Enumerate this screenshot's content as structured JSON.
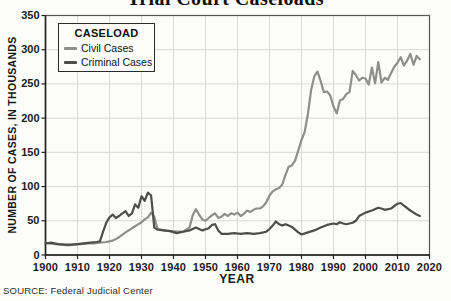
{
  "title": "Trial Court Caseloads",
  "source_note": "SOURCE: Federal Judicial Center",
  "legend": {
    "title": "CASELOAD",
    "items": [
      "Civil Cases",
      "Criminal Cases"
    ]
  },
  "chart_data": {
    "type": "line",
    "title": "Trial Court Caseloads",
    "xlabel": "YEAR",
    "ylabel": "NUMBER OF CASES, IN THOUSANDS",
    "xlim": [
      1900,
      2020
    ],
    "ylim": [
      0,
      350
    ],
    "x_ticks": [
      1900,
      1910,
      1920,
      1930,
      1940,
      1950,
      1960,
      1970,
      1980,
      1990,
      2000,
      2010,
      2020
    ],
    "y_ticks": [
      0,
      50,
      100,
      150,
      200,
      250,
      300,
      350
    ],
    "grid": true,
    "legend_position": "top-left",
    "colors": {
      "grid": "#d9d9d9",
      "frame": "#555555",
      "axis": "#222222",
      "background": "#fcfcfa"
    },
    "series": [
      {
        "name": "Civil Cases",
        "color": "#8e8e8e",
        "points": [
          [
            1900,
            18
          ],
          [
            1901,
            17
          ],
          [
            1903,
            16
          ],
          [
            1905,
            15
          ],
          [
            1907,
            14
          ],
          [
            1909,
            15
          ],
          [
            1911,
            16
          ],
          [
            1913,
            17
          ],
          [
            1915,
            17
          ],
          [
            1917,
            18
          ],
          [
            1919,
            19
          ],
          [
            1921,
            21
          ],
          [
            1923,
            26
          ],
          [
            1925,
            33
          ],
          [
            1926,
            36
          ],
          [
            1928,
            42
          ],
          [
            1929,
            45
          ],
          [
            1930,
            48
          ],
          [
            1931,
            52
          ],
          [
            1932,
            55
          ],
          [
            1933,
            62
          ],
          [
            1934,
            56
          ],
          [
            1935,
            38
          ],
          [
            1937,
            36
          ],
          [
            1939,
            35
          ],
          [
            1941,
            34
          ],
          [
            1943,
            34
          ],
          [
            1945,
            40
          ],
          [
            1946,
            58
          ],
          [
            1947,
            67
          ],
          [
            1948,
            59
          ],
          [
            1949,
            52
          ],
          [
            1950,
            50
          ],
          [
            1951,
            54
          ],
          [
            1952,
            58
          ],
          [
            1953,
            61
          ],
          [
            1954,
            54
          ],
          [
            1955,
            56
          ],
          [
            1956,
            60
          ],
          [
            1957,
            57
          ],
          [
            1958,
            61
          ],
          [
            1959,
            59
          ],
          [
            1960,
            62
          ],
          [
            1961,
            57
          ],
          [
            1962,
            60
          ],
          [
            1963,
            65
          ],
          [
            1964,
            63
          ],
          [
            1965,
            66
          ],
          [
            1966,
            68
          ],
          [
            1967,
            68
          ],
          [
            1968,
            71
          ],
          [
            1969,
            77
          ],
          [
            1970,
            87
          ],
          [
            1971,
            93
          ],
          [
            1972,
            96
          ],
          [
            1973,
            98
          ],
          [
            1974,
            103
          ],
          [
            1975,
            117
          ],
          [
            1976,
            129
          ],
          [
            1977,
            131
          ],
          [
            1978,
            138
          ],
          [
            1979,
            153
          ],
          [
            1980,
            168
          ],
          [
            1981,
            180
          ],
          [
            1982,
            206
          ],
          [
            1983,
            241
          ],
          [
            1984,
            261
          ],
          [
            1985,
            268
          ],
          [
            1986,
            254
          ],
          [
            1987,
            238
          ],
          [
            1988,
            239
          ],
          [
            1989,
            233
          ],
          [
            1990,
            217
          ],
          [
            1991,
            207
          ],
          [
            1992,
            226
          ],
          [
            1993,
            228
          ],
          [
            1994,
            235
          ],
          [
            1995,
            238
          ],
          [
            1996,
            269
          ],
          [
            1997,
            263
          ],
          [
            1998,
            255
          ],
          [
            1999,
            259
          ],
          [
            2000,
            258
          ],
          [
            2001,
            249
          ],
          [
            2002,
            274
          ],
          [
            2003,
            251
          ],
          [
            2004,
            282
          ],
          [
            2005,
            252
          ],
          [
            2006,
            259
          ],
          [
            2007,
            256
          ],
          [
            2008,
            266
          ],
          [
            2009,
            275
          ],
          [
            2010,
            281
          ],
          [
            2011,
            289
          ],
          [
            2012,
            277
          ],
          [
            2013,
            284
          ],
          [
            2014,
            294
          ],
          [
            2015,
            278
          ],
          [
            2016,
            291
          ],
          [
            2017,
            286
          ]
        ]
      },
      {
        "name": "Criminal Cases",
        "color": "#4d4d4d",
        "points": [
          [
            1900,
            17
          ],
          [
            1902,
            18
          ],
          [
            1904,
            16
          ],
          [
            1906,
            15
          ],
          [
            1908,
            15
          ],
          [
            1910,
            16
          ],
          [
            1912,
            17
          ],
          [
            1914,
            18
          ],
          [
            1916,
            19
          ],
          [
            1917,
            20
          ],
          [
            1918,
            34
          ],
          [
            1919,
            47
          ],
          [
            1920,
            55
          ],
          [
            1921,
            59
          ],
          [
            1922,
            54
          ],
          [
            1923,
            57
          ],
          [
            1924,
            61
          ],
          [
            1925,
            64
          ],
          [
            1926,
            57
          ],
          [
            1927,
            61
          ],
          [
            1928,
            74
          ],
          [
            1929,
            69
          ],
          [
            1930,
            86
          ],
          [
            1931,
            79
          ],
          [
            1932,
            91
          ],
          [
            1933,
            87
          ],
          [
            1934,
            40
          ],
          [
            1935,
            37
          ],
          [
            1937,
            36
          ],
          [
            1939,
            35
          ],
          [
            1941,
            32
          ],
          [
            1943,
            34
          ],
          [
            1945,
            36
          ],
          [
            1947,
            40
          ],
          [
            1949,
            36
          ],
          [
            1951,
            39
          ],
          [
            1952,
            44
          ],
          [
            1953,
            45
          ],
          [
            1954,
            36
          ],
          [
            1955,
            31
          ],
          [
            1957,
            31
          ],
          [
            1959,
            32
          ],
          [
            1961,
            31
          ],
          [
            1963,
            32
          ],
          [
            1965,
            31
          ],
          [
            1967,
            32
          ],
          [
            1969,
            34
          ],
          [
            1970,
            38
          ],
          [
            1971,
            43
          ],
          [
            1972,
            49
          ],
          [
            1973,
            45
          ],
          [
            1974,
            43
          ],
          [
            1975,
            45
          ],
          [
            1976,
            43
          ],
          [
            1977,
            41
          ],
          [
            1978,
            37
          ],
          [
            1979,
            33
          ],
          [
            1980,
            30
          ],
          [
            1982,
            33
          ],
          [
            1984,
            36
          ],
          [
            1986,
            40
          ],
          [
            1988,
            44
          ],
          [
            1990,
            46
          ],
          [
            1991,
            45
          ],
          [
            1992,
            48
          ],
          [
            1993,
            46
          ],
          [
            1994,
            45
          ],
          [
            1996,
            47
          ],
          [
            1997,
            50
          ],
          [
            1998,
            57
          ],
          [
            2000,
            62
          ],
          [
            2002,
            65
          ],
          [
            2004,
            69
          ],
          [
            2005,
            68
          ],
          [
            2006,
            66
          ],
          [
            2008,
            68
          ],
          [
            2010,
            75
          ],
          [
            2011,
            76
          ],
          [
            2012,
            72
          ],
          [
            2014,
            65
          ],
          [
            2016,
            59
          ],
          [
            2017,
            57
          ]
        ]
      }
    ]
  }
}
